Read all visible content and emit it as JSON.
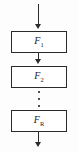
{
  "diagram": {
    "type": "vertical-flowchart",
    "background_color": "#fdfdfd",
    "line_color": "#2b2b2b",
    "box_fill_color": "#ffffff",
    "stages": [
      {
        "base": "F",
        "subscript": "1",
        "label": "F1"
      },
      {
        "base": "F",
        "subscript": "2",
        "label": "F2"
      },
      {
        "base": "F",
        "subscript": "R",
        "label": "FR"
      }
    ],
    "ellipsis": {
      "style": "vertical",
      "dots": 3,
      "glyph": "⋮"
    },
    "arrows": {
      "input_label": "",
      "between_1_2_label": "",
      "output_label": "",
      "direction": "down",
      "count": 4
    }
  }
}
